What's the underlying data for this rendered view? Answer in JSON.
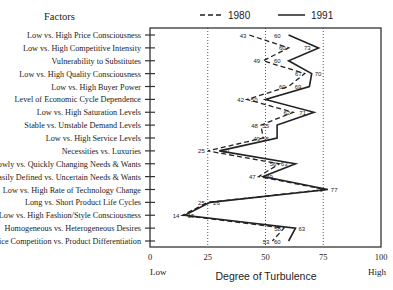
{
  "chart_data": {
    "type": "line",
    "orientation": "horizontal-profile",
    "title": "",
    "ylabel": "Factors",
    "xlabel": "Degree of Turbulence",
    "x_low_label": "Low",
    "x_high_label": "High",
    "xlim": [
      0,
      100
    ],
    "xticks": [
      0,
      25,
      50,
      75,
      100
    ],
    "xtick_labels": [
      "0",
      "25",
      "50",
      "75",
      "100"
    ],
    "gridlines_dotted_at": [
      25,
      50,
      75
    ],
    "legend_position": "top",
    "categories": [
      "Low vs. High Price Consciousness",
      "Low vs. High Competitive Intensity",
      "Vulnerability to Substitutes",
      "Low vs. High Quality Consciousness",
      "Low vs. High Buyer Power",
      "Level of Economic Cycle Dependence",
      "Low vs. High Saturation Levels",
      "Stable vs. Unstable Demand Levels",
      "Low vs. High Service Levels",
      "Necessities vs. Luxuries",
      "Slowly vs. Quickly Changing Needs & Wants",
      "Easily Defined vs. Uncertain Needs & Wants",
      "Low vs. High Rate of Technology Change",
      "Long vs. Short Product Life Cycles",
      "Low vs. High Fashion/Style Consciousness",
      "Homogeneous vs. Heterogeneous Desires",
      "Price Competition vs. Product Differentiation"
    ],
    "series": [
      {
        "name": "1980",
        "style": "dashed",
        "values": [
          43,
          60,
          49,
          67,
          60,
          42,
          62,
          48,
          49,
          25,
          56,
          47,
          76,
          25,
          14,
          58,
          53
        ]
      },
      {
        "name": "1991",
        "style": "solid",
        "values": [
          60,
          73,
          60,
          70,
          69,
          50,
          71,
          55,
          55,
          30,
          63,
          49,
          77,
          26,
          15,
          63,
          60
        ]
      }
    ]
  },
  "legend": {
    "items": [
      {
        "label": "1980",
        "style": "dashed"
      },
      {
        "label": "1991",
        "style": "solid"
      }
    ]
  },
  "axis": {
    "factors_header": "Factors",
    "x_title": "Degree of Turbulence",
    "low": "Low",
    "high": "High"
  },
  "colors": {
    "line": "#222222",
    "frame": "#333333",
    "grid": "#555555",
    "background": "#ffffff"
  }
}
